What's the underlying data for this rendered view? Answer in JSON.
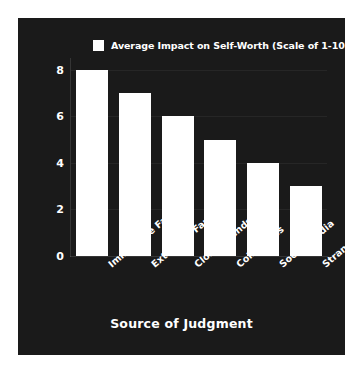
{
  "chart_data": {
    "type": "bar",
    "title": "",
    "categories": [
      "Immediate Family",
      "Extended Family",
      "Close Friends",
      "Colleagues",
      "Social Media",
      "Strangers"
    ],
    "values": [
      8,
      7,
      6,
      5,
      4,
      3
    ],
    "series": [
      {
        "name": "Average Impact on Self-Worth (Scale of 1-10)",
        "values": [
          8,
          7,
          6,
          5,
          4,
          3
        ]
      }
    ],
    "xlabel": "Source of Judgment",
    "ylabel": "",
    "ylim": [
      0,
      8.5
    ],
    "yticks": [
      0,
      2,
      4,
      6,
      8
    ],
    "ytick_labels": [
      "0",
      "2",
      "4",
      "6",
      "8"
    ],
    "grid": true,
    "legend": {
      "position": "top-left",
      "entries": [
        {
          "label": "Average Impact on Self-Worth (Scale of 1-10)",
          "color": "#ffffff"
        }
      ]
    },
    "colors": {
      "bar": "#ffffff",
      "background": "#1a1a1a",
      "page": "#ffffff",
      "text": "#ffffff",
      "grid": "#2a2a2a"
    }
  }
}
